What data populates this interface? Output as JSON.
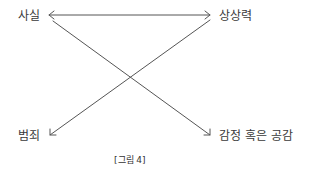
{
  "diagram": {
    "nodes": {
      "top_left": "사실",
      "top_right": "상상력",
      "bottom_left": "범죄",
      "bottom_right": "감정 혹은 공감"
    },
    "edges": [
      {
        "from": "사실",
        "to": "상상력",
        "type": "bidirectional"
      },
      {
        "from": "사실",
        "to": "감정 혹은 공감",
        "type": "directed"
      },
      {
        "from": "상상력",
        "to": "범죄",
        "type": "directed"
      }
    ],
    "caption": "[그림 4]",
    "line_color": "#555555"
  }
}
